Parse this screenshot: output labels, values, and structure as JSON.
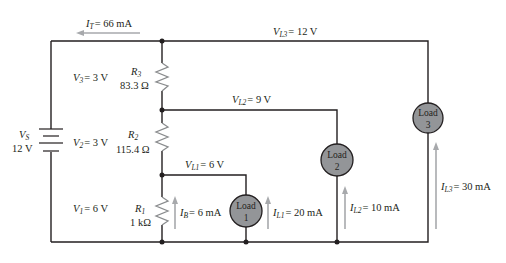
{
  "diagram": {
    "type": "voltage-divider-with-loads",
    "colors": {
      "wire": "#231f20",
      "arrow": "#a7a9ac",
      "load_fill": "#939598",
      "resistor": "#a7a9ac"
    },
    "source": {
      "symbol": "V",
      "subscript": "S",
      "value": "12 V"
    },
    "total_current": {
      "symbol": "I",
      "subscript": "T",
      "value": "= 66 mA"
    },
    "resistors": [
      {
        "id": "R3",
        "symbol": "R",
        "subscript": "3",
        "value": "83.3 Ω",
        "voltage_symbol": "V",
        "voltage_subscript": "3",
        "voltage": "= 3 V"
      },
      {
        "id": "R2",
        "symbol": "R",
        "subscript": "2",
        "value": "115.4 Ω",
        "voltage_symbol": "V",
        "voltage_subscript": "2",
        "voltage": "= 3 V"
      },
      {
        "id": "R1",
        "symbol": "R",
        "subscript": "1",
        "value": "1 kΩ",
        "voltage_symbol": "V",
        "voltage_subscript": "1",
        "voltage": "= 6 V"
      }
    ],
    "bleeder_current": {
      "symbol": "I",
      "subscript": "B",
      "value": "= 6 mA"
    },
    "loads": [
      {
        "id": "load1",
        "line1": "Load",
        "line2": "1",
        "voltage_symbol": "V",
        "voltage_subscript": "L1",
        "voltage": "= 6 V",
        "current_symbol": "I",
        "current_subscript": "L1",
        "current": "= 20 mA"
      },
      {
        "id": "load2",
        "line1": "Load",
        "line2": "2",
        "voltage_symbol": "V",
        "voltage_subscript": "L2",
        "voltage": "= 9 V",
        "current_symbol": "I",
        "current_subscript": "L2",
        "current": "= 10 mA"
      },
      {
        "id": "load3",
        "line1": "Load",
        "line2": "3",
        "voltage_symbol": "V",
        "voltage_subscript": "L3",
        "voltage": "= 12 V",
        "current_symbol": "I",
        "current_subscript": "L3",
        "current": "= 30 mA"
      }
    ]
  }
}
